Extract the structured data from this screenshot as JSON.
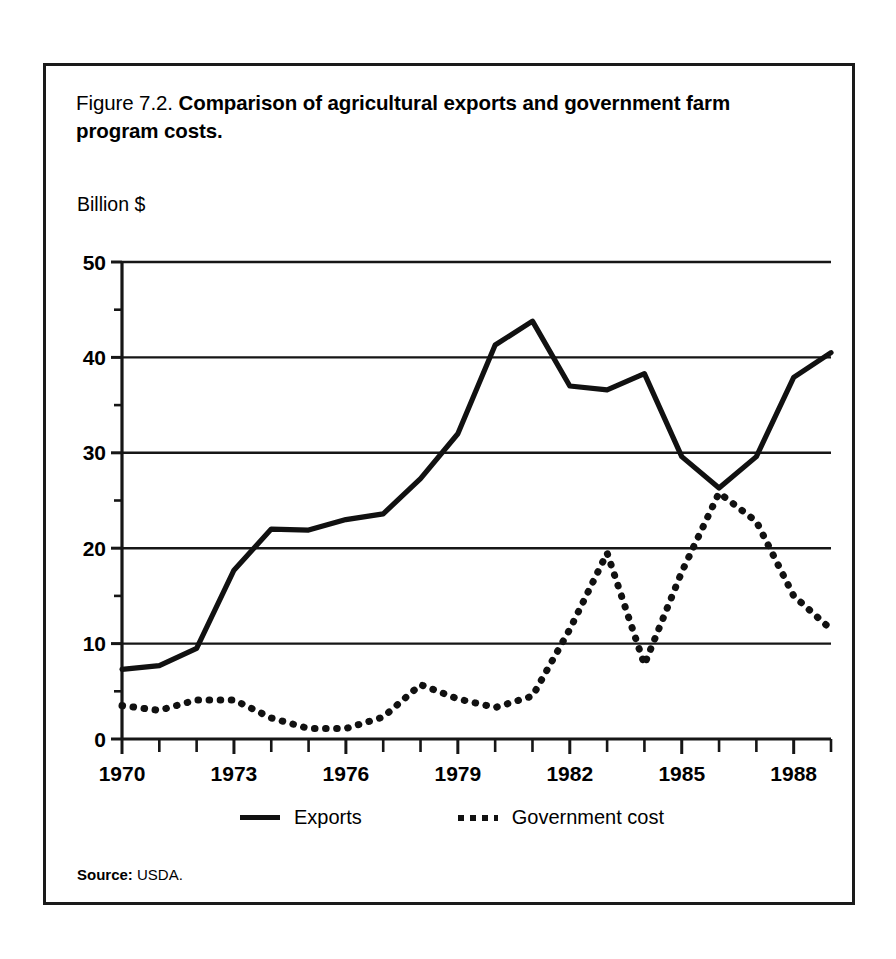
{
  "figure": {
    "number": "Figure 7.2.",
    "title": "Comparison of agricultural exports and government farm program costs.",
    "unit_label": "Billion $",
    "source_label": "Source:",
    "source_value": "USDA."
  },
  "legend": {
    "entries": [
      {
        "label": "Exports",
        "style": "solid",
        "color": "#111111"
      },
      {
        "label": "Government cost",
        "style": "dotted",
        "color": "#111111"
      }
    ]
  },
  "chart_data": {
    "type": "line",
    "title": "Comparison of agricultural exports and government farm program costs.",
    "xlabel": "",
    "ylabel": "Billion $",
    "xlim": [
      1970,
      1989
    ],
    "ylim": [
      0,
      50
    ],
    "grid": true,
    "legend_position": "below-plot",
    "x_tick_labels": [
      "1970",
      "1973",
      "1976",
      "1979",
      "1982",
      "1985",
      "1988"
    ],
    "x_tick_values": [
      1970,
      1973,
      1976,
      1979,
      1982,
      1985,
      1988
    ],
    "x_minor_tick_step": 1,
    "y_tick_labels": [
      "0",
      "10",
      "20",
      "30",
      "40",
      "50"
    ],
    "y_tick_values": [
      0,
      10,
      20,
      30,
      40,
      50
    ],
    "y_minor_tick_step": 5,
    "x": [
      1970,
      1971,
      1972,
      1973,
      1974,
      1975,
      1976,
      1977,
      1978,
      1979,
      1980,
      1981,
      1982,
      1983,
      1984,
      1985,
      1986,
      1987,
      1988,
      1989
    ],
    "series": [
      {
        "name": "Exports",
        "style": "solid",
        "color": "#111111",
        "values": [
          7.3,
          7.7,
          9.5,
          17.7,
          22.0,
          21.9,
          23.0,
          23.6,
          27.3,
          32.0,
          41.3,
          43.8,
          37.0,
          36.6,
          38.3,
          29.6,
          26.3,
          29.6,
          37.9,
          40.5
        ]
      },
      {
        "name": "Government cost",
        "style": "dotted",
        "color": "#111111",
        "values": [
          3.5,
          3.0,
          4.1,
          4.1,
          2.2,
          1.1,
          1.1,
          2.3,
          5.7,
          4.2,
          3.3,
          4.5,
          11.5,
          19.5,
          7.8,
          17.5,
          25.8,
          22.8,
          15.0,
          11.5
        ]
      }
    ]
  },
  "plot_geometry": {
    "left": 76,
    "top": 196,
    "width": 709,
    "height": 477
  }
}
